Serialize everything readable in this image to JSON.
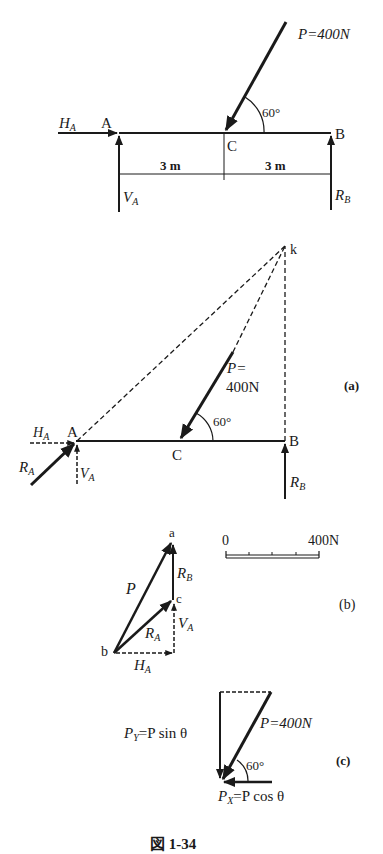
{
  "figure_caption": "図 1-34",
  "top_figure": {
    "force_label": "P=400N",
    "angle_label": "60°",
    "points": {
      "A": "A",
      "B": "B",
      "C": "C"
    },
    "reactions": {
      "HA": "H",
      "HA_sub": "A",
      "VA": "V",
      "VA_sub": "A",
      "RB": "R",
      "RB_sub": "B"
    },
    "dimensions": [
      "3 m",
      "3 m"
    ]
  },
  "figure_a": {
    "panel_label": "(a)",
    "force_label_line1": "P=",
    "force_label_line2": "400N",
    "angle_label": "60°",
    "points": {
      "A": "A",
      "B": "B",
      "C": "C",
      "k": "k"
    },
    "reactions": {
      "HA": "H",
      "HA_sub": "A",
      "VA": "V",
      "VA_sub": "A",
      "RA": "R",
      "RA_sub": "A",
      "RB": "R",
      "RB_sub": "B"
    }
  },
  "figure_b": {
    "panel_label": "(b)",
    "points": {
      "a": "a",
      "b": "b",
      "c": "c"
    },
    "vectors": {
      "P": "P",
      "RB": "R",
      "RB_sub": "B",
      "RA": "R",
      "RA_sub": "A",
      "VA": "V",
      "VA_sub": "A",
      "HA": "H",
      "HA_sub": "A"
    },
    "scale": {
      "start": "0",
      "end": "400N",
      "divisions": 4
    }
  },
  "figure_c": {
    "panel_label": "(c)",
    "force_label": "P=400N",
    "angle_label": "60°",
    "py_label": "P",
    "py_sub": "Y",
    "py_expr": "=P sin θ",
    "px_label": "P",
    "px_sub": "X",
    "px_expr": "=P cos θ"
  }
}
